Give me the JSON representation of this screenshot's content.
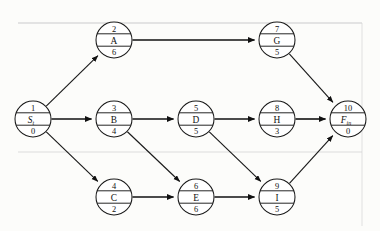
{
  "diagram": {
    "type": "project-network",
    "node_format": "top = activity number, middle = activity name, bottom = duration",
    "nodes": [
      {
        "id": "start",
        "number": "1",
        "name": "S",
        "subscript": "t",
        "duration": "0",
        "italic": true,
        "cx": 33,
        "cy": 119,
        "r": 18
      },
      {
        "id": "A",
        "number": "2",
        "name": "A",
        "subscript": "",
        "duration": "6",
        "italic": false,
        "cx": 114,
        "cy": 40,
        "r": 18
      },
      {
        "id": "B",
        "number": "3",
        "name": "B",
        "subscript": "",
        "duration": "4",
        "italic": false,
        "cx": 114,
        "cy": 119,
        "r": 18
      },
      {
        "id": "C",
        "number": "4",
        "name": "C",
        "subscript": "",
        "duration": "2",
        "italic": false,
        "cx": 114,
        "cy": 197,
        "r": 18
      },
      {
        "id": "D",
        "number": "5",
        "name": "D",
        "subscript": "",
        "duration": "5",
        "italic": false,
        "cx": 196,
        "cy": 119,
        "r": 18
      },
      {
        "id": "E",
        "number": "6",
        "name": "E",
        "subscript": "",
        "duration": "6",
        "italic": false,
        "cx": 196,
        "cy": 197,
        "r": 18
      },
      {
        "id": "G",
        "number": "7",
        "name": "G",
        "subscript": "",
        "duration": "5",
        "italic": false,
        "cx": 277,
        "cy": 40,
        "r": 18
      },
      {
        "id": "H",
        "number": "8",
        "name": "H",
        "subscript": "",
        "duration": "3",
        "italic": false,
        "cx": 277,
        "cy": 119,
        "r": 18
      },
      {
        "id": "I",
        "number": "9",
        "name": "I",
        "subscript": "",
        "duration": "5",
        "italic": false,
        "cx": 277,
        "cy": 197,
        "r": 18
      },
      {
        "id": "fin",
        "number": "10",
        "name": "F",
        "subscript": "in",
        "duration": "0",
        "italic": true,
        "cx": 348,
        "cy": 119,
        "r": 18
      }
    ],
    "edges": [
      {
        "id": "start-A",
        "from": "start",
        "to": "A",
        "emphasis": "normal"
      },
      {
        "id": "start-B",
        "from": "start",
        "to": "B",
        "emphasis": "thick"
      },
      {
        "id": "start-C",
        "from": "start",
        "to": "C",
        "emphasis": "normal"
      },
      {
        "id": "A-G",
        "from": "A",
        "to": "G",
        "emphasis": "thick"
      },
      {
        "id": "B-D",
        "from": "B",
        "to": "D",
        "emphasis": "thick"
      },
      {
        "id": "B-E",
        "from": "B",
        "to": "E",
        "emphasis": "normal"
      },
      {
        "id": "C-E",
        "from": "C",
        "to": "E",
        "emphasis": "thick"
      },
      {
        "id": "D-H",
        "from": "D",
        "to": "H",
        "emphasis": "thick"
      },
      {
        "id": "D-I",
        "from": "D",
        "to": "I",
        "emphasis": "normal"
      },
      {
        "id": "E-I",
        "from": "E",
        "to": "I",
        "emphasis": "thick"
      },
      {
        "id": "G-fin",
        "from": "G",
        "to": "fin",
        "emphasis": "normal"
      },
      {
        "id": "H-fin",
        "from": "H",
        "to": "fin",
        "emphasis": "thick"
      },
      {
        "id": "I-fin",
        "from": "I",
        "to": "fin",
        "emphasis": "normal"
      }
    ],
    "colors": {
      "stroke": "#1a1a1a",
      "node_fill": "#ffffff",
      "page": "#fcfcfa",
      "rule": "#cfcfcf"
    },
    "page_rules": [
      {
        "id": "rule-top",
        "y": 23
      },
      {
        "id": "rule-bottom",
        "y": 152
      }
    ]
  }
}
